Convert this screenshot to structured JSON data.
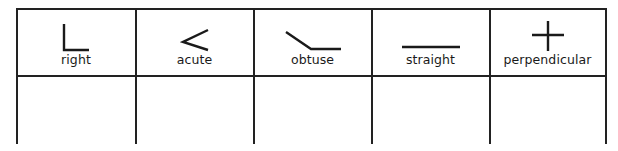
{
  "table": {
    "columns": [
      {
        "label": "right",
        "icon": "right-angle-icon"
      },
      {
        "label": "acute",
        "icon": "acute-angle-icon"
      },
      {
        "label": "obtuse",
        "icon": "obtuse-angle-icon"
      },
      {
        "label": "straight",
        "icon": "straight-line-icon"
      },
      {
        "label": "perpendicular",
        "icon": "perpendicular-lines-icon"
      }
    ],
    "answer_row": [
      "",
      "",
      "",
      "",
      ""
    ]
  },
  "colors": {
    "line": "#222222",
    "background": "#ffffff"
  }
}
